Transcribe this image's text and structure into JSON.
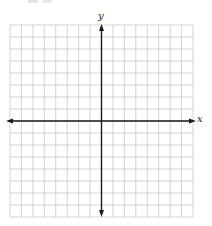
{
  "diagram": {
    "type": "coordinate-grid",
    "x_axis_label": "x",
    "y_axis_label": "y",
    "grid": {
      "columns": 16,
      "rows": 16,
      "left": 10,
      "top": 25,
      "right": 193,
      "bottom": 217
    },
    "origin": {
      "x": 101.5,
      "y": 121
    },
    "colors": {
      "grid_line": "#c8c8c8",
      "axis": "#1a1a1a",
      "background": "#ffffff"
    }
  }
}
